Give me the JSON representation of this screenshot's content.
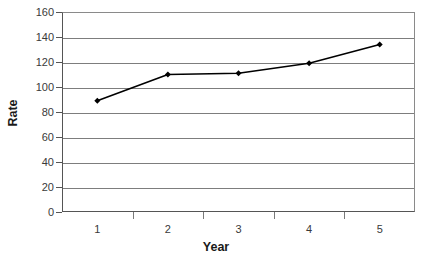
{
  "chart_data": {
    "type": "line",
    "title": "",
    "xlabel": "Year",
    "ylabel": "Rate",
    "categories": [
      "1",
      "2",
      "3",
      "4",
      "5"
    ],
    "values": [
      89,
      110,
      111,
      119,
      134
    ],
    "series": [
      {
        "name": "Rate",
        "values": [
          89,
          110,
          111,
          119,
          134
        ]
      }
    ],
    "ylim": [
      0,
      160
    ],
    "yticks": [
      0,
      20,
      40,
      60,
      80,
      100,
      120,
      140,
      160
    ],
    "ytick_labels": [
      "0",
      "20",
      "40",
      "60",
      "80",
      "100",
      "120",
      "140",
      "160"
    ],
    "grid": true,
    "grid_axis": "y",
    "legend": false,
    "legend_position": "none",
    "marker": "diamond",
    "line_color": "#000000",
    "marker_color": "#000000",
    "grid_color": "#7d7d7d",
    "axis_color": "#555555",
    "background_color": "#ffffff"
  },
  "axes": {
    "y_title": "Rate",
    "x_title": "Year"
  }
}
